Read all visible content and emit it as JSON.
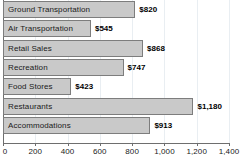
{
  "chart_data": {
    "type": "bar",
    "orientation": "horizontal",
    "title": "",
    "subtitle": "",
    "xlabel": "",
    "ylabel": "",
    "categories": [
      "Ground Transportation",
      "Air Transportation",
      "Retail Sales",
      "Recreation",
      "Food Stores",
      "Restaurants",
      "Accommodations"
    ],
    "values": [
      820,
      545,
      868,
      747,
      423,
      1180,
      913
    ],
    "value_labels": [
      "$820",
      "$545",
      "$868",
      "$747",
      "$423",
      "$1,180",
      "$913"
    ],
    "xlim": [
      0,
      1400
    ],
    "xticks": [
      0,
      200,
      400,
      600,
      800,
      1000,
      1200,
      1400
    ],
    "xtick_labels": [
      "0",
      "200",
      "400",
      "600",
      "800",
      "1,000",
      "1,200",
      "1,400"
    ],
    "grid": true,
    "grid_axis": "x",
    "legend": false,
    "bar_fill_color": "#c9c9c9",
    "bar_border_color": "#7d7d7d",
    "axis_color": "#6e6e6e",
    "gridline_color": "#e9eef2",
    "label_color": "#1a1a1a"
  }
}
